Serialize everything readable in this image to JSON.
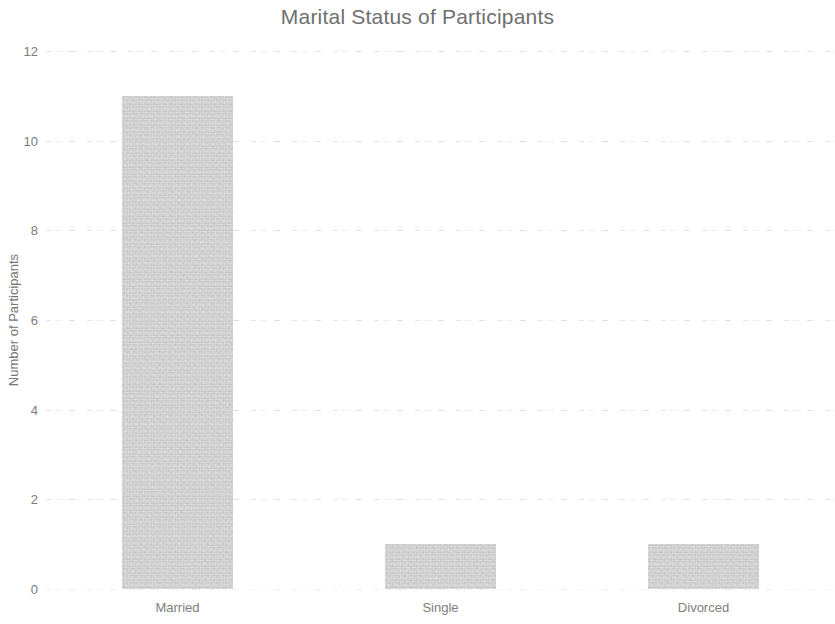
{
  "chart_data": {
    "type": "bar",
    "title": "Marital Status of Participants",
    "xlabel": "",
    "ylabel": "Number of Participants",
    "categories": [
      "Married",
      "Single",
      "Divorced"
    ],
    "values": [
      11,
      1,
      1
    ],
    "ylim": [
      0,
      12
    ],
    "yticks": [
      0,
      2,
      4,
      6,
      8,
      10,
      12
    ],
    "ytick_labels": [
      "0",
      "2",
      "4",
      "6",
      "8",
      "10",
      "12"
    ],
    "grid": true,
    "grid_axis": "y",
    "legend": false,
    "legend_position": "none",
    "bar_color": "#c9c9c9",
    "text_color": "#7d7d7d",
    "title_color": "#6f6f6f",
    "background_color": "#ffffff",
    "series": [
      {
        "name": "Number of Participants",
        "values": [
          11,
          1,
          1
        ]
      }
    ]
  }
}
